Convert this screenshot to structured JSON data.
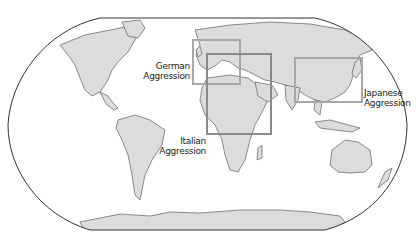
{
  "map": {
    "projection": "world-robinson-style",
    "colors": {
      "land": "#dcdcdc",
      "coast": "#6f6f6f",
      "ocean": "#ffffff",
      "border": "#333333",
      "box_light": "#a8a8a8",
      "box_dark": "#8a8a8a"
    },
    "regions": [
      {
        "id": "german",
        "label_line1": "German",
        "label_line2": "Aggression",
        "box": {
          "x": 193,
          "y": 40,
          "w": 47,
          "h": 44
        }
      },
      {
        "id": "italian",
        "label_line1": "Italian",
        "label_line2": "Aggression",
        "box": {
          "x": 207,
          "y": 54,
          "w": 64,
          "h": 80
        }
      },
      {
        "id": "japanese",
        "label_line1": "Japanese",
        "label_line2": "Aggression",
        "box": {
          "x": 295,
          "y": 58,
          "w": 67,
          "h": 44
        }
      }
    ]
  }
}
